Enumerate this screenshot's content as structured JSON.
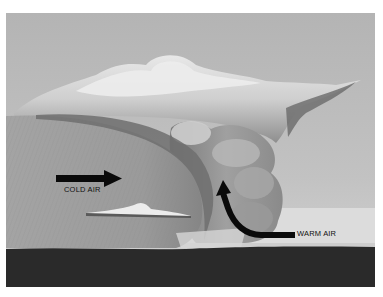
{
  "figure": {
    "labels": {
      "cold_air": "COLD AIR",
      "warm_air": "WARM AIR"
    },
    "arrows": [
      {
        "name": "cold-air-arrow",
        "direction": "right",
        "label": "COLD AIR"
      },
      {
        "name": "warm-air-arrow",
        "direction": "curving up-left",
        "label": "WARM AIR"
      }
    ],
    "colors": {
      "sky": "#b8b8b8",
      "cloud_light": "#e6e6e6",
      "cloud_mid": "#a6a6a6",
      "cloud_dark": "#6e6e6e",
      "cold_air_mass": "#9c9c9c",
      "ground": "#2a2a2a",
      "arrow": "#0a0a0a"
    }
  }
}
